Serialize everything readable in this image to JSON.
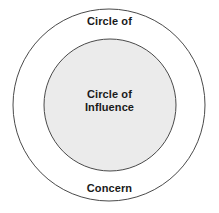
{
  "diagram": {
    "name": "circle-of-concern-influence",
    "background_color": "#ffffff",
    "outer_circle": {
      "label_top": "Circle of",
      "label_bottom": "Concern",
      "fill_color": "#ffffff",
      "stroke_color": "#4a4a4a",
      "stroke_width": 1,
      "center_x": 109,
      "center_y": 105,
      "radius": 96
    },
    "inner_circle": {
      "label_line_1": "Circle of",
      "label_line_2": "Influence",
      "fill_color": "#ebebeb",
      "stroke_color": "#4a4a4a",
      "stroke_width": 1,
      "center_x": 110,
      "center_y": 105,
      "radius": 66
    },
    "text_color": "#1a1a1a"
  },
  "chart_data": {
    "type": "diagram",
    "title": "",
    "shape": "concentric-circles",
    "series": [
      {
        "name": "Circle of Concern",
        "label": "Circle of Concern",
        "level": 1,
        "radius": 96,
        "fill": "#ffffff"
      },
      {
        "name": "Circle of Influence",
        "label": "Circle of Influence",
        "level": 2,
        "radius": 66,
        "fill": "#ebebeb"
      }
    ]
  }
}
